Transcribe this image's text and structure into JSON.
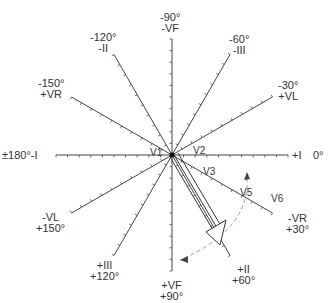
{
  "diagram": {
    "type": "hexaxial-reference-system",
    "center": {
      "x": 172,
      "y": 155
    },
    "axis_labels": [
      {
        "id": "m90",
        "line1": "-90°",
        "line2": "-VF",
        "x": 160,
        "y": 12
      },
      {
        "id": "m60",
        "line1": "-60°",
        "line2": "-III",
        "x": 229,
        "y": 34
      },
      {
        "id": "m30",
        "line1": "-30°",
        "line2": "+VL",
        "x": 278,
        "y": 80
      },
      {
        "id": "m120",
        "line1": "-120°",
        "line2": "-II",
        "x": 90,
        "y": 32
      },
      {
        "id": "m150",
        "line1": "-150°",
        "line2": "+VR",
        "x": 38,
        "y": 78
      },
      {
        "id": "p150",
        "line1": "-VL",
        "line2": "+150°",
        "x": 36,
        "y": 212
      },
      {
        "id": "p120",
        "line1": "+III",
        "line2": "+120°",
        "x": 90,
        "y": 260
      },
      {
        "id": "p90",
        "line1": "+VF",
        "line2": "+90°",
        "x": 160,
        "y": 280
      },
      {
        "id": "p60",
        "line1": "+II",
        "line2": "+60°",
        "x": 232,
        "y": 264
      },
      {
        "id": "p30",
        "line1": "-VR",
        "line2": "+30°",
        "x": 286,
        "y": 213
      }
    ],
    "left_label": "±180°-I",
    "right_label_lead": "+I",
    "right_label_deg": "0°",
    "precordial_leads": [
      {
        "name": "V1",
        "x": 150,
        "y": 148
      },
      {
        "name": "V2",
        "x": 193,
        "y": 146
      },
      {
        "name": "V3",
        "x": 203,
        "y": 167
      },
      {
        "name": "V5",
        "x": 240,
        "y": 188
      },
      {
        "name": "V6",
        "x": 271,
        "y": 194
      }
    ],
    "vector_angle_deg": 60
  }
}
